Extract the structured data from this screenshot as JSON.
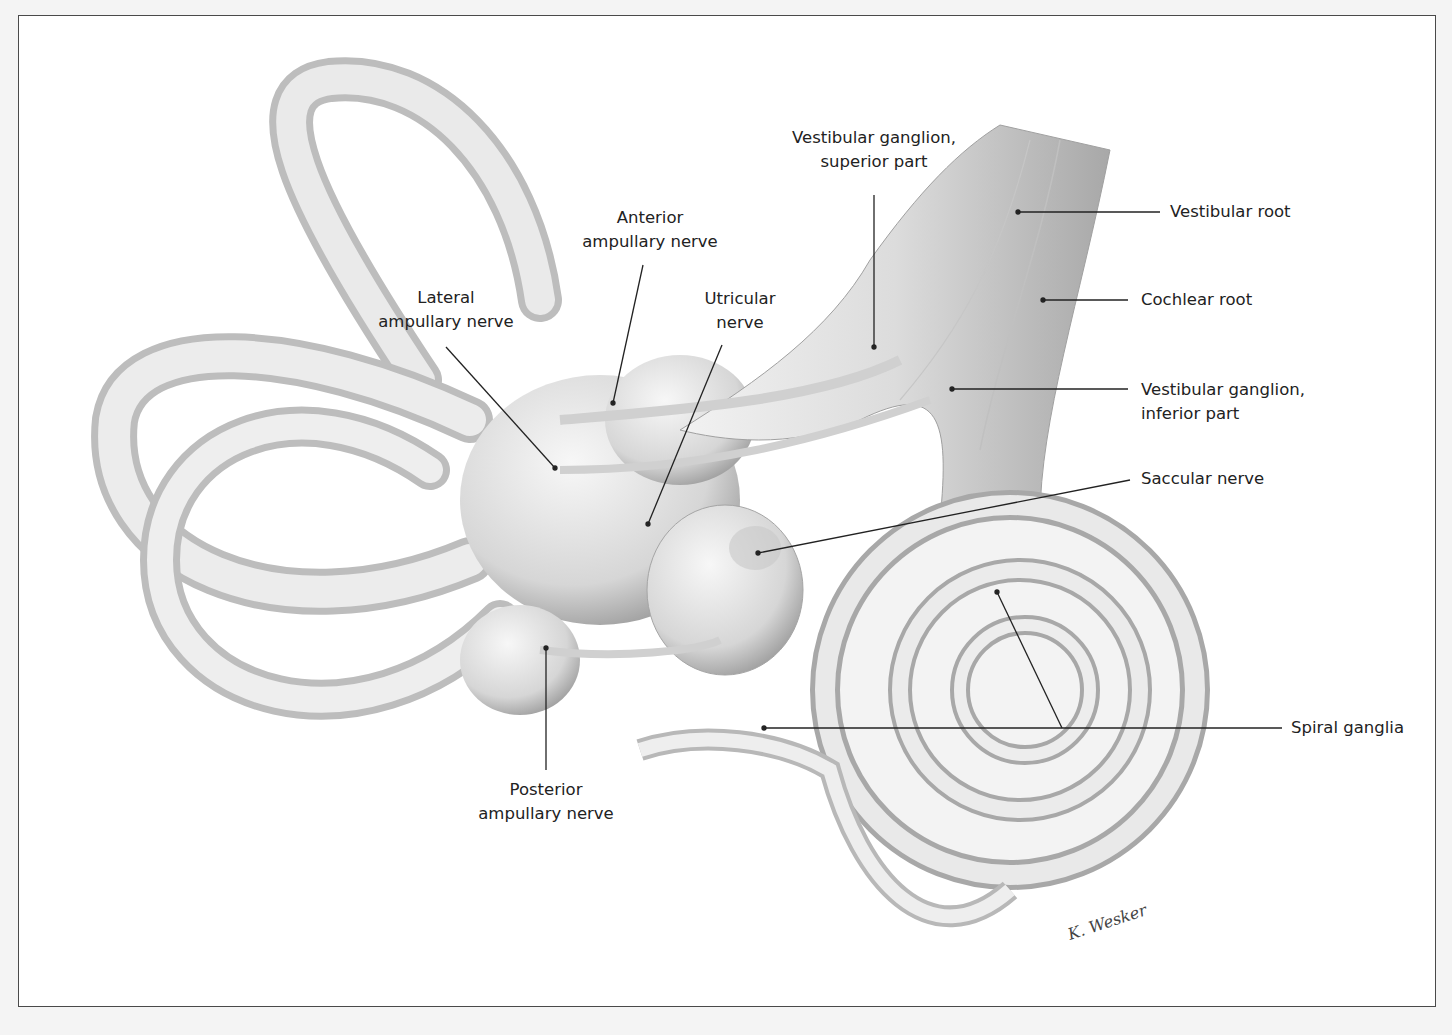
{
  "figure": {
    "signature": "K. Wesker",
    "colors": {
      "background": "#ffffff",
      "frame": "#4a4a4a",
      "structure_fill": "#e6e6e6",
      "structure_shade": "#9a9a9a",
      "leader_line": "#222222",
      "text": "#222222"
    }
  },
  "labels": {
    "vestibular_ganglion_superior": {
      "line1": "Vestibular ganglion,",
      "line2": "superior part"
    },
    "vestibular_root": {
      "text": "Vestibular root"
    },
    "anterior_ampullary": {
      "line1": "Anterior",
      "line2": "ampullary nerve"
    },
    "utricular": {
      "line1": "Utricular",
      "line2": "nerve"
    },
    "lateral_ampullary": {
      "line1": "Lateral",
      "line2": "ampullary nerve"
    },
    "cochlear_root": {
      "text": "Cochlear root"
    },
    "vestibular_ganglion_inferior": {
      "line1": "Vestibular ganglion,",
      "line2": "inferior part"
    },
    "saccular": {
      "text": "Saccular nerve"
    },
    "spiral_ganglia": {
      "text": "Spiral ganglia"
    },
    "posterior_ampullary": {
      "line1": "Posterior",
      "line2": "ampullary nerve"
    }
  }
}
